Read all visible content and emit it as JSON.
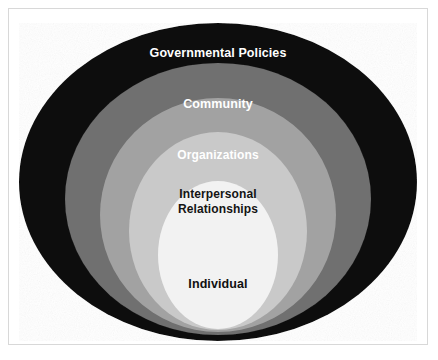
{
  "figure": {
    "background_color": "#ffffff",
    "frame_color": "#d8d8d8"
  },
  "diagram": {
    "type": "nested-ellipses",
    "layers": [
      {
        "id": "governmental-policies",
        "label": "Governmental Policies",
        "level": 1,
        "position": "outermost",
        "fill_color": "#111111",
        "text_color": "#ffffff",
        "cx": 209,
        "cy": 173,
        "rx": 199,
        "ry": 159
      },
      {
        "id": "community",
        "label": "Community",
        "level": 2,
        "fill_color": "#6f6f6f",
        "text_color": "#ffffff",
        "cx": 209,
        "cy": 190,
        "rx": 153,
        "ry": 136
      },
      {
        "id": "organizations",
        "label": "Organizations",
        "level": 3,
        "fill_color": "#a2a2a2",
        "text_color": "#ffffff",
        "cx": 209,
        "cy": 206,
        "rx": 118,
        "ry": 117
      },
      {
        "id": "interpersonal-relationships",
        "label": "Interpersonal\nRelationships",
        "level": 4,
        "fill_color": "#c9c9c9",
        "text_color": "#141414",
        "cx": 209,
        "cy": 222,
        "rx": 89,
        "ry": 99
      },
      {
        "id": "individual",
        "label": "Individual",
        "level": 5,
        "position": "innermost",
        "fill_color": "#f2f2f2",
        "text_color": "#101010",
        "cx": 209,
        "cy": 246,
        "rx": 60,
        "ry": 74
      }
    ]
  }
}
